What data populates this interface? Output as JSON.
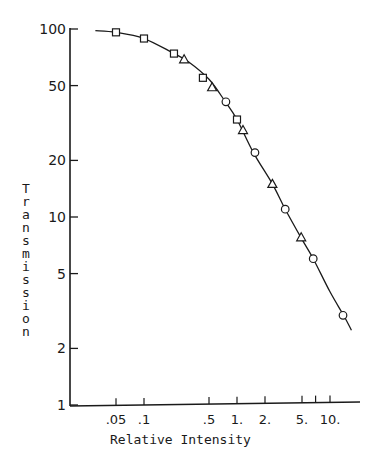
{
  "chart_data": {
    "type": "scatter",
    "title": "",
    "xlabel": "Relative Intensity",
    "ylabel": "Transmission",
    "xscale": "log",
    "yscale": "log",
    "xlim": [
      0.025,
      18
    ],
    "ylim": [
      1,
      100
    ],
    "grid": false,
    "legend": null,
    "x_ticks": [
      0.05,
      0.1,
      0.5,
      1,
      2,
      5,
      7,
      10
    ],
    "x_tick_labels": [
      ".05",
      ".1",
      ".5",
      "1.",
      "2.",
      "5.",
      "",
      "10."
    ],
    "y_ticks": [
      100,
      50,
      20,
      10,
      5,
      2,
      1
    ],
    "y_tick_labels": [
      "100",
      "50",
      "20",
      "10",
      "5",
      "2",
      "1"
    ],
    "series": [
      {
        "name": "squares",
        "marker": "square",
        "x": [
          0.05,
          0.1,
          0.21,
          0.43,
          1.0
        ],
        "y": [
          96,
          89,
          74,
          55,
          33
        ]
      },
      {
        "name": "triangles",
        "marker": "triangle",
        "x": [
          0.27,
          0.54,
          1.16,
          2.4,
          4.9
        ],
        "y": [
          69,
          49,
          29,
          15,
          7.8
        ]
      },
      {
        "name": "circles",
        "marker": "circle",
        "x": [
          0.76,
          1.56,
          3.3,
          6.6,
          13.8
        ],
        "y": [
          41,
          22,
          11,
          6.0,
          3.0
        ]
      }
    ],
    "fit_curve": {
      "name": "smooth curve",
      "x": [
        0.03,
        0.05,
        0.1,
        0.2,
        0.3,
        0.5,
        0.75,
        1.0,
        1.5,
        2.4,
        3.3,
        5,
        6.6,
        10,
        14,
        17
      ],
      "y": [
        98,
        96,
        89,
        75,
        67,
        54,
        41,
        33,
        22,
        15,
        11,
        7.6,
        6.0,
        4.0,
        3.0,
        2.5
      ]
    }
  },
  "axes": {
    "y_title_letters": [
      "T",
      "r",
      "a",
      "n",
      "s",
      "m",
      "i",
      "s",
      "s",
      "i",
      "o",
      "n"
    ]
  }
}
